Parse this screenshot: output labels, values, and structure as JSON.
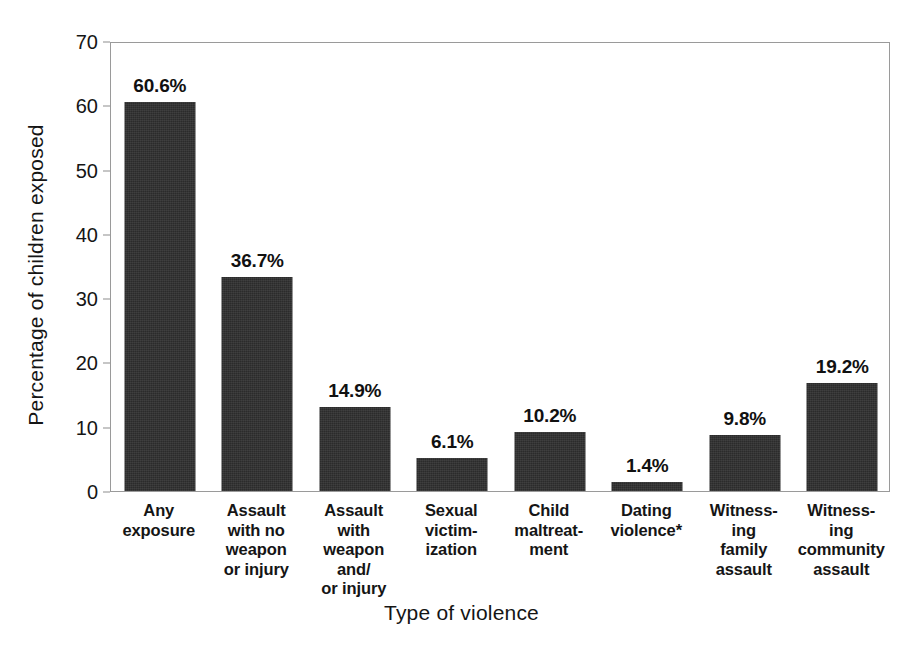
{
  "chart_data": {
    "type": "bar",
    "title": "",
    "xlabel": "Type of violence",
    "ylabel": "Percentage of children exposed",
    "ylim": [
      0,
      70
    ],
    "ytick_step": 10,
    "yticks": [
      "70",
      "60",
      "50",
      "40",
      "30",
      "20",
      "10",
      "0"
    ],
    "grid": false,
    "legend": "none",
    "bar_color": "#2b2b2b",
    "categories": [
      "Any exposure",
      "Assault with no weapon or injury",
      "Assault with weapon and/ or injury",
      "Sexual victim- ization",
      "Child maltreat- ment",
      "Dating violence*",
      "Witness- ing family assault",
      "Witness- ing community assault"
    ],
    "category_lines": [
      [
        "Any",
        "exposure"
      ],
      [
        "Assault",
        "with no",
        "weapon",
        "or injury"
      ],
      [
        "Assault",
        "with",
        "weapon",
        "and/",
        "or injury"
      ],
      [
        "Sexual",
        "victim-",
        "ization"
      ],
      [
        "Child",
        "maltreat-",
        "ment"
      ],
      [
        "Dating",
        "violence*"
      ],
      [
        "Witness-",
        "ing",
        "family",
        "assault"
      ],
      [
        "Witness-",
        "ing",
        "community",
        "assault"
      ]
    ],
    "values": [
      60.6,
      36.7,
      14.9,
      6.1,
      10.2,
      1.4,
      9.8,
      19.2
    ],
    "value_labels": [
      "60.6%",
      "36.7%",
      "14.9%",
      "6.1%",
      "10.2%",
      "1.4%",
      "9.8%",
      "19.2%"
    ],
    "bar_pixel_heights": [
      389,
      214,
      84,
      33,
      59,
      9,
      56,
      108
    ],
    "footnote_marker": "*"
  }
}
